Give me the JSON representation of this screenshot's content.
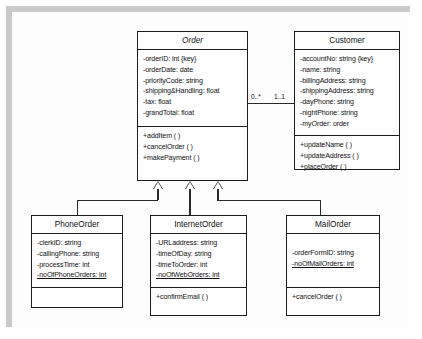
{
  "diagram": {
    "kind": "uml-class-diagram",
    "colors": {
      "frame": "#c9c9c9",
      "canvas": "#fdfdfd",
      "line": "#2a2a2a",
      "box_border": "#1d1d1d",
      "box_fill": "#ffffff",
      "text": "#111111"
    }
  },
  "classes": {
    "order": {
      "name": "Order",
      "abstract": true,
      "attributes": [
        "-orderID: int {key}",
        "-orderDate: date",
        "-priorityCode: string",
        "-shipping&Handling: float",
        "-tax: float",
        "-grandTotal: float"
      ],
      "operations": [
        "+addItem ( )",
        "+cancelOrder ( )",
        "+makePayment ( )"
      ]
    },
    "customer": {
      "name": "Customer",
      "abstract": false,
      "attributes": [
        "-accountNo: string {key}",
        "-name: string",
        "-billingAddress: string",
        "-shippingAddress: string",
        "-dayPhone: string",
        "-nightPhone: string",
        "-myOrder: order"
      ],
      "operations": [
        "+updateName ( )",
        "+updateAddress ( )",
        "+placeOrder ( )"
      ]
    },
    "phone_order": {
      "name": "PhoneOrder",
      "abstract": false,
      "attributes": [
        "-clerkID: string",
        "-callingPhone: string",
        "-processTime: int",
        "-noOfPhoneOrders: int"
      ],
      "static_attributes": [
        "-noOfPhoneOrders: int"
      ],
      "operations": []
    },
    "internet_order": {
      "name": "InternetOrder",
      "abstract": false,
      "attributes": [
        "-URLaddress: string",
        "-timeOfDay: string",
        "-timeToOrder: int",
        "-noOfWebOrders: int"
      ],
      "static_attributes": [
        "-noOfWebOrders: int"
      ],
      "operations": [
        "+confirmEmail ( )"
      ]
    },
    "mail_order": {
      "name": "MailOrder",
      "abstract": false,
      "attributes": [
        "-orderFormID: string",
        "-noOfMailOrders: int"
      ],
      "static_attributes": [
        "-noOfMailOrders: int"
      ],
      "operations": [
        "+cancelOrder ( )"
      ]
    }
  },
  "associations": {
    "order_customer": {
      "source": "Order",
      "target": "Customer",
      "source_multiplicity": "0..*",
      "target_multiplicity": "1..1"
    }
  },
  "generalizations": [
    {
      "parent": "Order",
      "child": "PhoneOrder"
    },
    {
      "parent": "Order",
      "child": "InternetOrder"
    },
    {
      "parent": "Order",
      "child": "MailOrder"
    }
  ]
}
